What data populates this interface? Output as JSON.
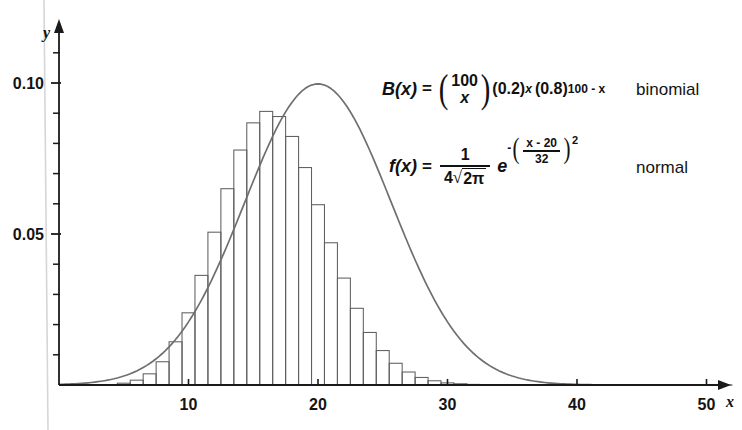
{
  "figure": {
    "axes": {
      "x_axis_letter": "x",
      "y_axis_letter": "y",
      "x_ticks_labeled": [
        10,
        20,
        30,
        40,
        50
      ],
      "x_tick_labels": [
        "10",
        "20",
        "30",
        "40",
        "50"
      ],
      "y_ticks_labeled": [
        0.05,
        0.1
      ],
      "y_tick_labels": [
        "0.05",
        "0.10"
      ],
      "y_minor_step": 0.01,
      "xlim": [
        0,
        52
      ],
      "ylim": [
        0,
        0.118
      ],
      "axis_color": "#1a1a1a"
    },
    "annotations": {
      "binomial_label": "binomial",
      "normal_label": "normal",
      "binomial_formula": {
        "fn": "B(x)",
        "equals": "=",
        "choose_top": "100",
        "choose_bottom": "x",
        "p_base": "(0.2)",
        "p_exp": "x",
        "q_base": "(0.8)",
        "q_exp": "100 - x"
      },
      "normal_formula": {
        "fn": "f(x)",
        "equals": "=",
        "numerator": "1",
        "denominator_coeff": "4",
        "denominator_radicand": "2π",
        "e": "e",
        "exp_minus": "-",
        "exp_num": "x - 20",
        "exp_den": "32",
        "exp_power": "2"
      }
    },
    "colors": {
      "curve": "#6f6f6f",
      "bars": "#5f5f5f",
      "axis": "#1a1a1a",
      "artifact_line": "#d6d6d6",
      "background": "#ffffff"
    },
    "geometry": {
      "origin_x": 59,
      "origin_y": 385,
      "px_per_x_unit": 12.95,
      "px_per_y_unit": 3020,
      "bar_width_units": 1.0
    }
  },
  "chart_data": {
    "type": "bar",
    "title": "",
    "xlabel": "x",
    "ylabel": "y",
    "xlim": [
      0,
      52
    ],
    "ylim": [
      0,
      0.118
    ],
    "grid": false,
    "legend_position": "inside-right",
    "x_ticks": [
      10,
      20,
      30,
      40,
      50
    ],
    "y_ticks": [
      0.05,
      0.1
    ],
    "series": [
      {
        "name": "binomial",
        "type": "bar",
        "formula": "B(x) = C(100,x)(0.2)^x(0.8)^(100-x)",
        "x": [
          5,
          6,
          7,
          8,
          9,
          10,
          11,
          12,
          13,
          14,
          15,
          16,
          17,
          18,
          19,
          20,
          21,
          22,
          23,
          24,
          25,
          26,
          27,
          28,
          29,
          30,
          31,
          32,
          33,
          34,
          35,
          36,
          37
        ],
        "values": [
          0.0006,
          0.0016,
          0.0037,
          0.0077,
          0.0143,
          0.0239,
          0.0363,
          0.0506,
          0.065,
          0.0778,
          0.0868,
          0.0906,
          0.0889,
          0.0823,
          0.072,
          0.0597,
          0.0471,
          0.0354,
          0.0254,
          0.0174,
          0.0114,
          0.0072,
          0.0043,
          0.0025,
          0.0014,
          0.0007,
          0.0004,
          0.0002,
          0.0001,
          4e-05,
          2e-05,
          1e-05,
          3e-06
        ]
      },
      {
        "name": "normal",
        "type": "line",
        "formula": "f(x) = 1/(4*sqrt(2*pi)) * e^(-((x-20)/32)^2)",
        "mean": 20,
        "peak_value": 0.0997,
        "sigma": 4
      }
    ]
  }
}
